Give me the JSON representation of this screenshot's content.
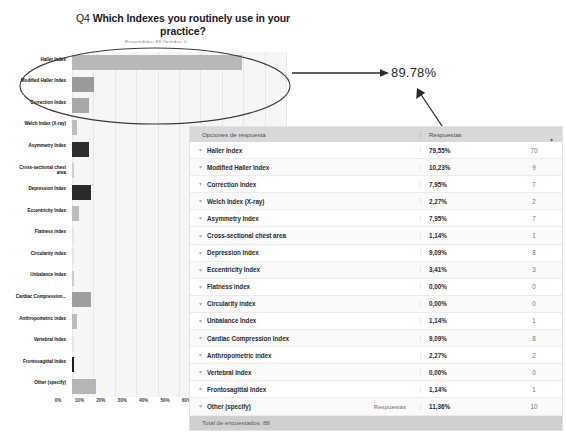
{
  "title": {
    "question_number": "Q4",
    "line1": "Which Indexes you routinely use in your",
    "line2": "practice?",
    "subtitle": "Respondidas: 88    Omitidas: 0"
  },
  "annotation": {
    "value_label": "89.78%"
  },
  "table": {
    "header": {
      "options_label": "Opciones de respuesta",
      "responses_label": "Respuestas",
      "sort_icon": "chevron-down-icon"
    },
    "row_caret_icon": "caret-down-icon",
    "rows": [
      {
        "label": "Haller Index",
        "sub": "",
        "percent": "79,55%",
        "count": "70"
      },
      {
        "label": "Modified Haller Index",
        "sub": "",
        "percent": "10,23%",
        "count": "9"
      },
      {
        "label": "Correction Index",
        "sub": "",
        "percent": "7,95%",
        "count": "7"
      },
      {
        "label": "Welch Index (X-ray)",
        "sub": "",
        "percent": "2,27%",
        "count": "2"
      },
      {
        "label": "Asymmetry Index",
        "sub": "",
        "percent": "7,95%",
        "count": "7"
      },
      {
        "label": "Cross-sectional chest area",
        "sub": "",
        "percent": "1,14%",
        "count": "1"
      },
      {
        "label": "Depression Index",
        "sub": "",
        "percent": "9,09%",
        "count": "8"
      },
      {
        "label": "Eccentricity Index",
        "sub": "",
        "percent": "3,41%",
        "count": "3"
      },
      {
        "label": "Flatness index",
        "sub": "",
        "percent": "0,00%",
        "count": "0"
      },
      {
        "label": "Circularity index",
        "sub": "",
        "percent": "0,00%",
        "count": "0"
      },
      {
        "label": "Unbalance Index",
        "sub": "",
        "percent": "1,14%",
        "count": "1"
      },
      {
        "label": "Cardiac Compression Index",
        "sub": "",
        "percent": "9,09%",
        "count": "8"
      },
      {
        "label": "Anthropometric index",
        "sub": "",
        "percent": "2,27%",
        "count": "2"
      },
      {
        "label": "Vertebral Index",
        "sub": "",
        "percent": "0,00%",
        "count": "0"
      },
      {
        "label": "Frontosagittal Index",
        "sub": "",
        "percent": "1,14%",
        "count": "1"
      },
      {
        "label": "Other (specify)",
        "sub": "Respuestas",
        "percent": "11,36%",
        "count": "10"
      }
    ],
    "footer": "Total de encuestados: 88"
  },
  "chart_data": {
    "type": "bar",
    "orientation": "horizontal",
    "title": "Q4 Which Indexes you routinely use in your practice?",
    "xlabel": "",
    "ylabel": "",
    "xlim": [
      0,
      100
    ],
    "xticks": [
      "0%",
      "10%",
      "20%",
      "30%",
      "40%",
      "50%",
      "60%",
      "70%",
      "80%",
      "90%",
      "100%"
    ],
    "grid": true,
    "legend": "none",
    "categories": [
      "Haller Index",
      "Modified Haller Index",
      "Correction Index",
      "Welch Index (X-ray)",
      "Asymmetry Index",
      "Cross-sectional chest area",
      "Depression Index",
      "Eccentricity Index",
      "Flatness index",
      "Circularity index",
      "Unbalance Index",
      "Cardiac Compression...",
      "Anthropometric index",
      "Vertebral Index",
      "Frontosagittal Index",
      "Other (specify)"
    ],
    "values": [
      79.55,
      10.23,
      7.95,
      2.27,
      7.95,
      1.14,
      9.09,
      3.41,
      0.0,
      0.0,
      1.14,
      9.09,
      2.27,
      0.0,
      1.14,
      11.36
    ],
    "counts": [
      70,
      9,
      7,
      2,
      7,
      1,
      8,
      3,
      0,
      0,
      1,
      8,
      2,
      0,
      1,
      10
    ],
    "bar_colors": [
      "#b8b8b8",
      "#9a9a9a",
      "#a8a8a8",
      "#bdbdbd",
      "#2e2e2e",
      "#cfcfcf",
      "#2a2a2a",
      "#bcbcbc",
      "#e4e4e4",
      "#e4e4e4",
      "#cccccc",
      "#9e9e9e",
      "#bbbbbb",
      "#e4e4e4",
      "#1d1d1d",
      "#b5b5b5"
    ],
    "plot_background": "#f6f6f6"
  },
  "colors": {
    "table_header_bg": "#d8d8d8",
    "table_footer_bg": "#cfcfcf",
    "annotation_ink": "#2b2b2b"
  }
}
